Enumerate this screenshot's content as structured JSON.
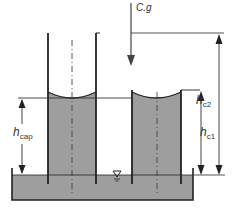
{
  "diagram": {
    "labels": {
      "cg": "C.g",
      "h_cap_main": "h",
      "h_cap_sub": "cap",
      "h_c1_main": "h",
      "h_c1_sub": "c1",
      "h_c2_main": "h",
      "h_c2_sub": "c2",
      "free_surface_symbol": "▽"
    },
    "colors": {
      "liquid": "#9e9e9e",
      "lines": "#222222",
      "dimension": "#444444",
      "background": "#ffffff"
    }
  }
}
